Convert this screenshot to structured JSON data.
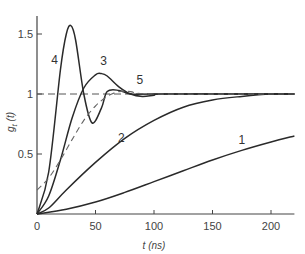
{
  "chart_data": {
    "type": "line",
    "title": "",
    "xlabel": "t (ns)",
    "ylabel": "g_t(t)",
    "xlim": [
      0,
      220
    ],
    "ylim": [
      0,
      1.65
    ],
    "grid": false,
    "x_ticks": [
      0,
      50,
      100,
      150,
      200
    ],
    "x_tick_labels": [
      "0",
      "50",
      "100",
      "150",
      "200"
    ],
    "y_ticks": [
      0.5,
      1,
      1.5
    ],
    "y_tick_labels": [
      "0.5",
      "1",
      "1.5"
    ],
    "reference_line": {
      "y": 1,
      "style": "dashed"
    },
    "series": [
      {
        "name": "1",
        "style": "solid",
        "x": [
          0,
          25,
          50,
          75,
          100,
          125,
          150,
          175,
          200,
          220
        ],
        "y": [
          0,
          0.04,
          0.1,
          0.18,
          0.27,
          0.36,
          0.45,
          0.53,
          0.6,
          0.65
        ]
      },
      {
        "name": "2",
        "style": "solid",
        "x": [
          0,
          10,
          25,
          50,
          75,
          100,
          125,
          150,
          175,
          200,
          220
        ],
        "y": [
          0,
          0.05,
          0.2,
          0.43,
          0.63,
          0.78,
          0.89,
          0.95,
          0.98,
          1.0,
          1.0
        ]
      },
      {
        "name": "3",
        "style": "solid",
        "x": [
          0,
          10,
          20,
          30,
          40,
          50,
          55,
          60,
          70,
          80,
          90,
          100,
          110,
          220
        ],
        "y": [
          0,
          0.15,
          0.45,
          0.8,
          1.05,
          1.16,
          1.17,
          1.15,
          1.06,
          1.0,
          0.98,
          0.99,
          1.0,
          1.0
        ]
      },
      {
        "name": "4",
        "style": "solid",
        "x": [
          0,
          10,
          20,
          25,
          29,
          33,
          40,
          47,
          55,
          60,
          70,
          80,
          100,
          220
        ],
        "y": [
          0,
          0.35,
          1.2,
          1.5,
          1.57,
          1.45,
          1.0,
          0.76,
          0.88,
          1.02,
          1.03,
          1.0,
          1.0,
          1.0
        ]
      },
      {
        "name": "5",
        "style": "dashed",
        "x": [
          0,
          10,
          20,
          30,
          40,
          50,
          60,
          70,
          80,
          100,
          220
        ],
        "y": [
          0.2,
          0.3,
          0.45,
          0.62,
          0.78,
          0.9,
          0.98,
          1.02,
          1.02,
          1.0,
          1.0
        ]
      }
    ],
    "annotations": [
      {
        "text": "1",
        "x": 175,
        "y": 0.58
      },
      {
        "text": "2",
        "x": 72,
        "y": 0.6
      },
      {
        "text": "3",
        "x": 57,
        "y": 1.24
      },
      {
        "text": "4",
        "x": 15,
        "y": 1.25
      },
      {
        "text": "5",
        "x": 88,
        "y": 1.08
      }
    ]
  }
}
